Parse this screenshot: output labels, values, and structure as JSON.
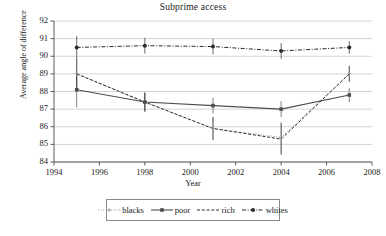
{
  "chart_data": {
    "type": "line",
    "title": "Subprime access",
    "xlabel": "Year",
    "ylabel": "Average angle of difference",
    "x": [
      1995,
      1998,
      2001,
      2004,
      2007
    ],
    "xlim": [
      1994,
      2008
    ],
    "ylim": [
      84,
      92
    ],
    "xticks": [
      "1994",
      "1996",
      "1998",
      "2000",
      "2002",
      "2004",
      "2006",
      "2008"
    ],
    "xtick_values": [
      1994,
      1996,
      1998,
      2000,
      2002,
      2004,
      2006,
      2008
    ],
    "yticks": [
      "84",
      "85",
      "86",
      "87",
      "88",
      "89",
      "90",
      "91",
      "92"
    ],
    "ytick_values": [
      84,
      85,
      86,
      87,
      88,
      89,
      90,
      91,
      92
    ],
    "grid": "horizontal",
    "legend_position": "bottom",
    "series": [
      {
        "name": "blacks",
        "style": "dotted",
        "marker": "plus",
        "color": "#9a9a9a",
        "values": [
          89.0,
          87.4,
          85.9,
          85.4,
          89.0
        ],
        "errors": [
          0.85,
          0.55,
          0.65,
          0.9,
          0.45
        ]
      },
      {
        "name": "poor",
        "style": "solid",
        "marker": "square",
        "color": "#4d4d4d",
        "values": [
          88.1,
          87.4,
          87.2,
          87.0,
          87.8
        ],
        "errors": [
          1.0,
          0.5,
          0.45,
          0.45,
          0.4
        ]
      },
      {
        "name": "rich",
        "style": "dashed",
        "marker": "none",
        "color": "#2b2b2b",
        "values": [
          89.0,
          87.4,
          85.9,
          85.3,
          89.0
        ],
        "errors": [
          0.85,
          0.55,
          0.65,
          0.9,
          0.45
        ]
      },
      {
        "name": "whites",
        "style": "dashdot",
        "marker": "circle",
        "color": "#2b2b2b",
        "values": [
          90.5,
          90.6,
          90.55,
          90.3,
          90.5
        ],
        "errors": [
          0.65,
          0.45,
          0.45,
          0.45,
          0.35
        ]
      }
    ]
  }
}
